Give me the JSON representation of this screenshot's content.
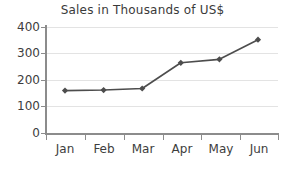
{
  "chart_data": {
    "type": "line",
    "title": "Sales in Thousands of US$",
    "xlabel": "",
    "ylabel": "",
    "categories": [
      "Jan",
      "Feb",
      "Mar",
      "Apr",
      "May",
      "Jun"
    ],
    "values": [
      160,
      162,
      168,
      265,
      278,
      352
    ],
    "series": [
      {
        "name": "Sales",
        "values": [
          160,
          162,
          168,
          265,
          278,
          352
        ]
      }
    ],
    "ylim": [
      0,
      400
    ],
    "yticks": [
      0,
      100,
      200,
      300,
      400
    ],
    "ytick_labels": [
      "0",
      "100",
      "200",
      "300",
      "400"
    ],
    "grid": true,
    "legend": "none",
    "marker": "diamond",
    "line_color": "#4d4d4d",
    "marker_color": "#4d4d4d",
    "grid_color": "#e3e3e3",
    "axis_color": "#8c8c8c",
    "text_color": "#3d3d3d",
    "background": "#ffffff"
  },
  "axis": {
    "y_labels": [
      "400",
      "300",
      "200",
      "100",
      "0"
    ],
    "x_labels": [
      "Jan",
      "Feb",
      "Mar",
      "Apr",
      "May",
      "Jun"
    ]
  }
}
